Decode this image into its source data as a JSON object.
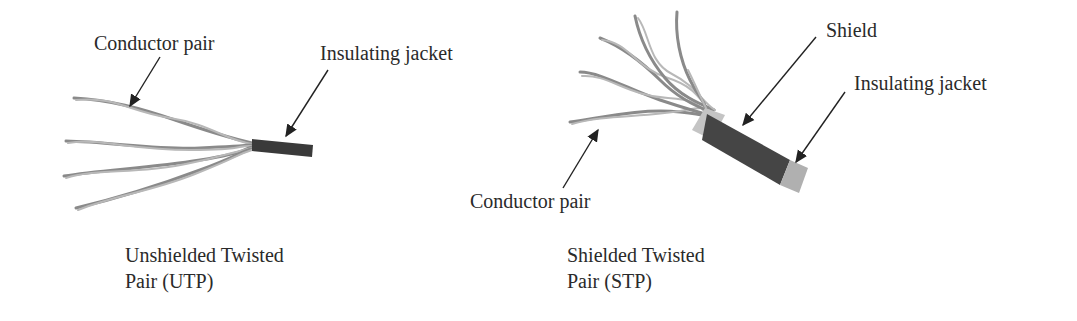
{
  "diagram": {
    "utp": {
      "labels": {
        "conductor_pair": "Conductor pair",
        "insulating_jacket": "Insulating jacket"
      },
      "caption_line1": "Unshielded Twisted",
      "caption_line2": "Pair (UTP)"
    },
    "stp": {
      "labels": {
        "shield": "Shield",
        "insulating_jacket": "Insulating jacket",
        "conductor_pair": "Conductor pair"
      },
      "caption_line1": "Shielded Twisted",
      "caption_line2": "Pair (STP)"
    },
    "colors": {
      "jacket_dark": "#3a3a3a",
      "shield": "#454545",
      "jacket_light": "#b0b0b0",
      "wire": "#8a8a8a"
    }
  }
}
